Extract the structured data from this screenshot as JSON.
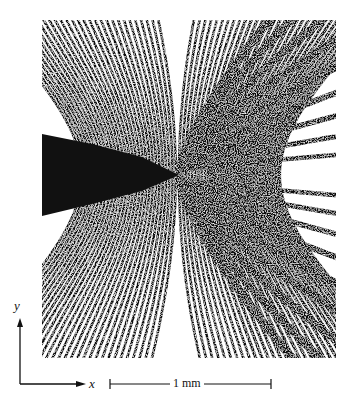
{
  "figure": {
    "colors": {
      "ink": "#111111",
      "paper": "#ffffff"
    }
  },
  "axes": {
    "y_label": "y",
    "x_label": "x"
  },
  "scale_bar": {
    "label": "1 mm"
  }
}
